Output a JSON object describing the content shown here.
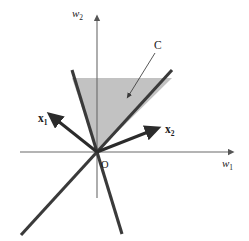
{
  "figure": {
    "background_color": "#ffffff",
    "width": 249,
    "height": 241
  },
  "colors": {
    "axis": "#555555",
    "ray": "#333333",
    "vector": "#2b2b2b",
    "cone_fill": "#c2c2c2",
    "leader": "#3a3a3a",
    "text": "#1a1a1a"
  },
  "labels": {
    "axis_vertical": {
      "base": "w",
      "sub": "2",
      "text": "w2"
    },
    "axis_horizontal": {
      "base": "w",
      "sub": "1",
      "text": "w1"
    },
    "vector_1": {
      "base": "x",
      "sub": "1",
      "text": "x1"
    },
    "vector_2": {
      "base": "x",
      "sub": "2",
      "text": "x2"
    },
    "cone": "C",
    "origin": "O"
  },
  "geometry": {
    "origin": {
      "x": 97,
      "y": 152
    },
    "axis_vertical": {
      "x1": 97,
      "y1": 198,
      "x2": 97,
      "y2": 18
    },
    "axis_horizontal": {
      "x1": 20,
      "y1": 152,
      "x2": 232,
      "y2": 152
    },
    "cone_edge_left": {
      "from": [
        97,
        152
      ],
      "to": [
        72,
        70
      ]
    },
    "cone_edge_right": {
      "from": [
        97,
        152
      ],
      "to": [
        172,
        70
      ]
    },
    "cone_fill_top_y": 78,
    "ray_extension_left_down": {
      "from": [
        97,
        152
      ],
      "to": [
        22,
        234
      ]
    },
    "ray_extension_right_down": {
      "from": [
        97,
        152
      ],
      "to": [
        122,
        234
      ]
    },
    "vector_1_tip": {
      "x": 55,
      "y": 119
    },
    "vector_2_tip": {
      "x": 153,
      "y": 130
    },
    "leader_line": {
      "from": [
        154,
        53
      ],
      "to": [
        127,
        97
      ]
    }
  }
}
